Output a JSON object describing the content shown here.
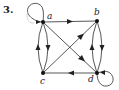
{
  "problem_number": "3.",
  "nodes": [
    {
      "id": "a",
      "label": "a",
      "x": 43,
      "y": 22
    },
    {
      "id": "b",
      "label": "b",
      "x": 97,
      "y": 21
    },
    {
      "id": "c",
      "label": "c",
      "x": 43,
      "y": 73
    },
    {
      "id": "d",
      "label": "d",
      "x": 97,
      "y": 73
    }
  ],
  "edges": [
    {
      "from": "a",
      "to": "a",
      "type": "loop"
    },
    {
      "from": "d",
      "to": "d",
      "type": "loop"
    },
    {
      "from": "a",
      "to": "b",
      "type": "straight"
    },
    {
      "from": "a",
      "to": "c",
      "type": "arc-right"
    },
    {
      "from": "c",
      "to": "a",
      "type": "arc-left"
    },
    {
      "from": "b",
      "to": "d",
      "type": "arc-right"
    },
    {
      "from": "d",
      "to": "b",
      "type": "arc-left"
    },
    {
      "from": "a",
      "to": "d",
      "type": "straight"
    },
    {
      "from": "c",
      "to": "b",
      "type": "straight"
    },
    {
      "from": "d",
      "to": "c",
      "type": "straight"
    }
  ],
  "colors": {
    "edge": "#444444",
    "node": "#111111",
    "background": "#ffffff"
  }
}
